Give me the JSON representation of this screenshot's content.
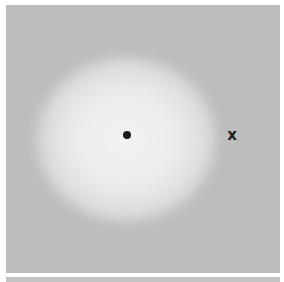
{
  "figure": {
    "background_color": "#bdbdbd",
    "glow_color": "#f0f0f0",
    "markers": [
      {
        "type": "dot",
        "symbol": "●",
        "x": 127,
        "y": 135
      },
      {
        "type": "cross",
        "symbol": "x",
        "x": 231,
        "y": 136
      }
    ]
  }
}
